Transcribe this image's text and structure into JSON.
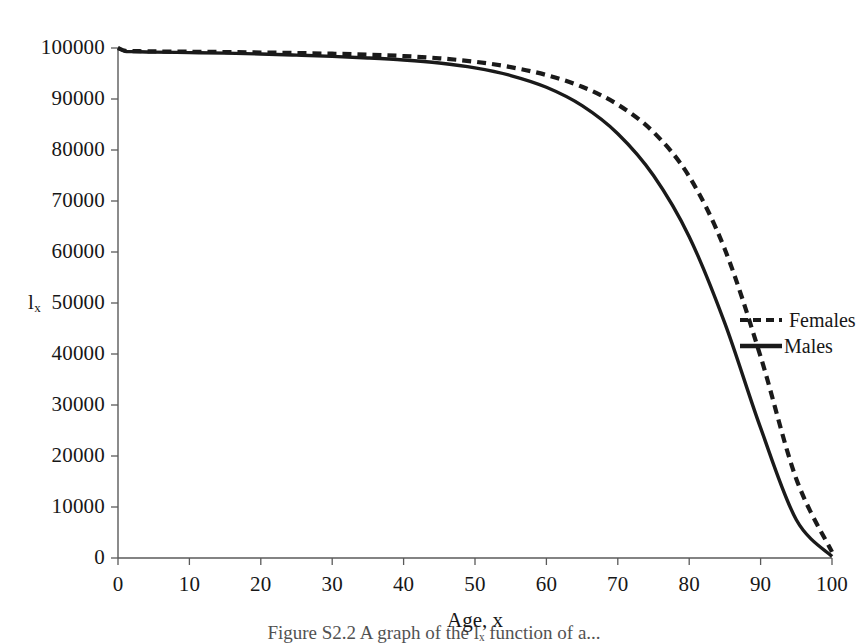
{
  "figure": {
    "caption": "Figure S2.2  A graph of the lₓ function of a..."
  },
  "chart_data": {
    "type": "line",
    "title": "",
    "xlabel": "Age, x",
    "ylabel": "l",
    "ylabel_subscript": "x",
    "xlim": [
      0,
      100
    ],
    "ylim": [
      0,
      100000
    ],
    "grid": false,
    "legend_position": "right",
    "xticks": [
      0,
      10,
      20,
      30,
      40,
      50,
      60,
      70,
      80,
      90,
      100
    ],
    "xtick_labels": [
      "0",
      "10",
      "20",
      "30",
      "40",
      "50",
      "60",
      "70",
      "80",
      "90",
      "100"
    ],
    "yticks": [
      0,
      10000,
      20000,
      30000,
      40000,
      50000,
      60000,
      70000,
      80000,
      90000,
      100000
    ],
    "ytick_labels": [
      "0",
      "10000",
      "20000",
      "30000",
      "40000",
      "50000",
      "60000",
      "70000",
      "80000",
      "90000",
      "100000"
    ],
    "x": [
      0,
      1,
      2,
      3,
      4,
      5,
      10,
      15,
      20,
      25,
      30,
      35,
      40,
      45,
      50,
      55,
      60,
      65,
      70,
      75,
      80,
      85,
      90,
      95,
      100
    ],
    "series": [
      {
        "name": "Females",
        "style": "dashed",
        "color": "#1a1a1a",
        "values": [
          100000,
          99450,
          99400,
          99370,
          99350,
          99330,
          99270,
          99210,
          99120,
          99010,
          98880,
          98700,
          98420,
          97980,
          97300,
          96250,
          94700,
          92400,
          88900,
          83500,
          74800,
          60500,
          39500,
          15500,
          1200
        ]
      },
      {
        "name": "Males",
        "style": "solid",
        "color": "#1a1a1a",
        "values": [
          100000,
          99350,
          99290,
          99250,
          99220,
          99190,
          99100,
          99000,
          98830,
          98600,
          98350,
          98050,
          97650,
          97050,
          96100,
          94600,
          92300,
          88700,
          83200,
          75000,
          63000,
          46000,
          25500,
          7500,
          300
        ]
      }
    ]
  },
  "axes": {
    "plot_left_px": 118,
    "plot_right_px": 832,
    "plot_top_px": 48,
    "plot_bottom_px": 558
  }
}
